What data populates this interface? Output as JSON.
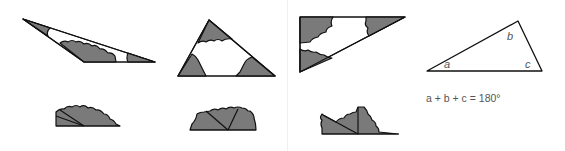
{
  "figure": {
    "labels": {
      "a": "a",
      "b": "b",
      "c": "c"
    },
    "equation": "a + b + c = 180°",
    "colors": {
      "fill": "#7a7a7a",
      "stroke": "#111111",
      "text": "#555555"
    }
  }
}
